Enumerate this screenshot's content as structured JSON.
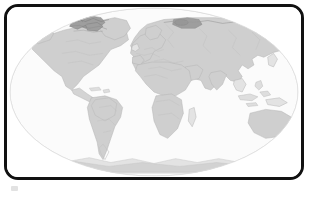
{
  "figure": {
    "kind": "world-map",
    "title": "",
    "caption": "",
    "frame": {
      "border_color": "#111111",
      "border_width_px": 3,
      "corner_radius_px": 14,
      "background_color": "#ffffff"
    }
  },
  "map": {
    "projection": "Robinson",
    "graticule_visible": false,
    "labels_visible": false,
    "legend_visible": false,
    "ocean_color": "#fbfbfb",
    "globe_outline_color": "#e2e2e2",
    "coastline_color": "#b9b9b9",
    "border_color": "#c6c6c6",
    "land_fill_default": "#f2f2f2",
    "shading_levels": [
      {
        "name": "none",
        "color": "#f4f4f4"
      },
      {
        "name": "low",
        "color": "#e3e3e3"
      },
      {
        "name": "medium",
        "color": "#cfcfcf"
      },
      {
        "name": "high",
        "color": "#bdbdbd"
      },
      {
        "name": "very-high",
        "color": "#9e9e9e"
      }
    ],
    "regions": [
      {
        "id": "north-america",
        "label": "North America",
        "shading": "medium"
      },
      {
        "id": "greenland",
        "label": "Greenland",
        "shading": "medium"
      },
      {
        "id": "canadian-arctic",
        "label": "Canadian Arctic Archipelago",
        "shading": "very-high"
      },
      {
        "id": "south-america",
        "label": "South America",
        "shading": "medium"
      },
      {
        "id": "amazon-basin",
        "label": "Amazon Basin",
        "shading": "medium"
      },
      {
        "id": "africa-north",
        "label": "Northern Africa",
        "shading": "medium"
      },
      {
        "id": "africa-south",
        "label": "Southern Africa",
        "shading": "medium"
      },
      {
        "id": "madagascar",
        "label": "Madagascar",
        "shading": "low"
      },
      {
        "id": "europe",
        "label": "Europe",
        "shading": "medium"
      },
      {
        "id": "asia",
        "label": "Asia",
        "shading": "medium"
      },
      {
        "id": "novaya-zemlya",
        "label": "Novaya Zemlya / Kara Sea",
        "shading": "very-high"
      },
      {
        "id": "india",
        "label": "India",
        "shading": "medium"
      },
      {
        "id": "southeast-asia",
        "label": "Southeast Asia",
        "shading": "low"
      },
      {
        "id": "australia",
        "label": "Australia",
        "shading": "medium"
      },
      {
        "id": "new-guinea",
        "label": "New Guinea",
        "shading": "low"
      },
      {
        "id": "new-zealand",
        "label": "New Zealand",
        "shading": "low"
      },
      {
        "id": "antarctica",
        "label": "Antarctica",
        "shading": "low"
      },
      {
        "id": "japan",
        "label": "Japan",
        "shading": "low"
      },
      {
        "id": "british-isles",
        "label": "British Isles",
        "shading": "low"
      },
      {
        "id": "iceland",
        "label": "Iceland",
        "shading": "low"
      }
    ]
  }
}
